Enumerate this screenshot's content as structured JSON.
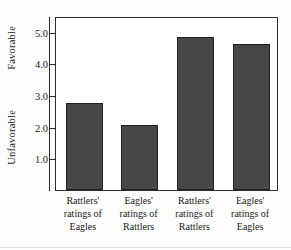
{
  "chart_data": {
    "type": "bar",
    "title": "",
    "xlabel": "",
    "ylabel": "",
    "ylim": [
      0.0,
      5.5
    ],
    "grid": false,
    "legend": "none",
    "axis_endpoint_labels": {
      "top": "Favorable",
      "bottom": "Unfavorable"
    },
    "ytick_labels": [
      "5.0",
      "4.0",
      "3.0",
      "2.0",
      "1.0"
    ],
    "ytick_values": [
      5.0,
      4.0,
      3.0,
      2.0,
      1.0
    ],
    "categories": [
      "Rattlers' ratings of Eagles",
      "Eagles' ratings of Rattlers",
      "Rattlers' ratings of Rattlers",
      "Eagles' ratings of Eagles"
    ],
    "category_lines": [
      [
        "Rattlers'",
        "ratings of",
        "Eagles"
      ],
      [
        "Eagles'",
        "ratings of",
        "Rattlers"
      ],
      [
        "Rattlers'",
        "ratings of",
        "Rattlers"
      ],
      [
        "Eagles'",
        "ratings of",
        "Eagles"
      ]
    ],
    "values": [
      2.75,
      2.05,
      4.85,
      4.6
    ],
    "bar_color": "#474747",
    "bar_edge_color": "#1f1f1f",
    "axis_color": "#2e2e2e",
    "background_color": "#ffffff"
  }
}
